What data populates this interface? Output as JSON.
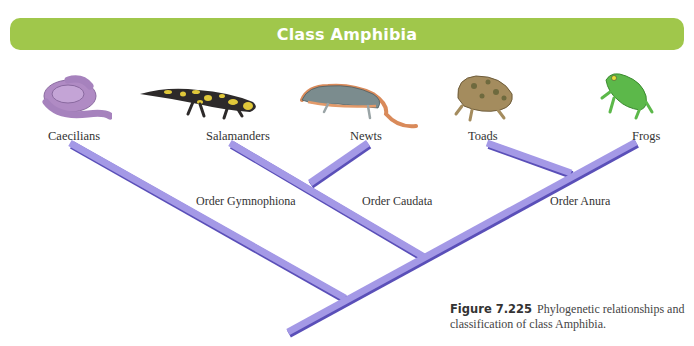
{
  "header": {
    "title": "Class Amphibia",
    "color": "#a0c74b"
  },
  "taxa": [
    {
      "name": "Caecilians",
      "icon": "caecilian-icon"
    },
    {
      "name": "Salamanders",
      "icon": "salamander-icon"
    },
    {
      "name": "Newts",
      "icon": "newt-icon"
    },
    {
      "name": "Toads",
      "icon": "toad-icon"
    },
    {
      "name": "Frogs",
      "icon": "frog-icon"
    }
  ],
  "orders": [
    {
      "name": "Order Gymnophiona"
    },
    {
      "name": "Order Caudata"
    },
    {
      "name": "Order Anura"
    }
  ],
  "branch_color": "#9b8fe0",
  "caption": {
    "figure_label": "Figure 7.225",
    "text": "Phylogenetic relationships and classification of class Amphibia."
  }
}
